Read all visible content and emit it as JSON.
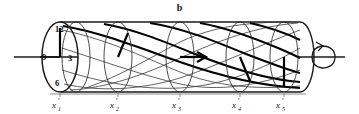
{
  "figure": {
    "panel_label": "b",
    "type": "cylinder-rotation-diagram",
    "colors": {
      "stroke": "#1a1a1a",
      "thin_stroke": "#3a3a3a",
      "helix_highlight": "#000000",
      "baseline": "#8c8c8c",
      "background": "#ffffff"
    }
  },
  "clock_face": {
    "numbers": [
      {
        "label": "12",
        "position": "top"
      },
      {
        "label": "3",
        "position": "right"
      },
      {
        "label": "6",
        "position": "bottom"
      },
      {
        "label": "9",
        "position": "left"
      }
    ],
    "hand_hour": "12",
    "hand_minute": "9"
  },
  "sections": [
    {
      "id": "s1",
      "label_base": "x",
      "prime": "′",
      "subscript": "1",
      "hand_clock": "12",
      "hand_angle_deg": 0
    },
    {
      "id": "s2",
      "label_base": "x",
      "prime": "′",
      "subscript": "2",
      "hand_clock": "1:30",
      "hand_angle_deg": 45
    },
    {
      "id": "s3",
      "label_base": "x",
      "prime": "′",
      "subscript": "3",
      "hand_clock": "3",
      "hand_angle_deg": 90
    },
    {
      "id": "s4",
      "label_base": "x",
      "prime": "′",
      "subscript": "4",
      "hand_clock": "4:30",
      "hand_angle_deg": 135
    },
    {
      "id": "s5",
      "label_base": "x",
      "prime": "′",
      "subscript": "5",
      "hand_clock": "6",
      "hand_angle_deg": 180
    }
  ],
  "axis": {
    "left_extends": true,
    "right_extends": true,
    "rotation_marker": "curved-rotation-arrow"
  },
  "helices": {
    "thin_count": 4,
    "thick_count": 1
  }
}
